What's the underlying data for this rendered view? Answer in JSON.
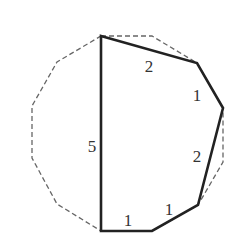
{
  "figure": {
    "type": "dodecagon-cut-polygon",
    "colors": {
      "solid_edge": "#222222",
      "dashed_edge": "#666666",
      "label": "#333333",
      "background": "#ffffff"
    },
    "solid_polygon": {
      "vertices": [
        [
          101,
          36
        ],
        [
          197,
          63
        ],
        [
          223,
          108
        ],
        [
          198,
          205
        ],
        [
          152,
          231
        ],
        [
          101,
          231
        ]
      ],
      "edge_labels": [
        {
          "text": "2",
          "x": 149,
          "y": 72
        },
        {
          "text": "1",
          "x": 197,
          "y": 101
        },
        {
          "text": "2",
          "x": 197,
          "y": 162
        },
        {
          "text": "1",
          "x": 169,
          "y": 215
        },
        {
          "text": "1",
          "x": 128,
          "y": 226
        },
        {
          "text": "5",
          "x": 92,
          "y": 152
        }
      ]
    },
    "dashed_polygon": {
      "vertices": [
        [
          101,
          36
        ],
        [
          152,
          36
        ],
        [
          197,
          63
        ],
        [
          223,
          108
        ],
        [
          223,
          162
        ],
        [
          198,
          205
        ],
        [
          152,
          231
        ],
        [
          101,
          231
        ],
        [
          57,
          204
        ],
        [
          32,
          158
        ],
        [
          32,
          106
        ],
        [
          57,
          62
        ]
      ]
    }
  }
}
